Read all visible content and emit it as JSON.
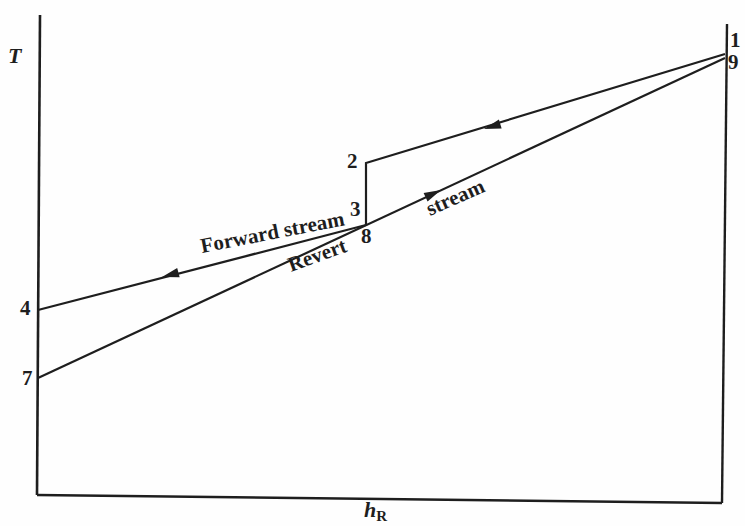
{
  "figure": {
    "paper_color": "#fefefe",
    "ink_color": "#1e1e1e",
    "width": 745,
    "height": 526,
    "axes": {
      "y_label": "T",
      "y_label_pos": {
        "x": 8,
        "y": 63
      },
      "x_label_base": "h",
      "x_label_subscript": "R",
      "x_label_pos": {
        "x": 364,
        "y": 517
      }
    },
    "frame": [
      {
        "name": "y-axis",
        "x1": 40,
        "y1": 15,
        "x2": 37,
        "y2": 495,
        "w": 2.6
      },
      {
        "name": "x-axis",
        "x1": 37,
        "y1": 495,
        "x2": 722,
        "y2": 503,
        "w": 2.4
      },
      {
        "name": "right-border",
        "x1": 727,
        "y1": 24,
        "x2": 722,
        "y2": 503,
        "w": 2.4
      }
    ],
    "streams": [
      {
        "name": "forward-stream",
        "path": [
          [
            725,
            54
          ],
          [
            366,
            163
          ],
          [
            366,
            225
          ],
          [
            38,
            310
          ]
        ],
        "arrows": [
          {
            "x": 484,
            "y": 129,
            "angle": 163.1
          },
          {
            "x": 162,
            "y": 277,
            "angle": 165
          }
        ]
      },
      {
        "name": "revert-stream",
        "path": [
          [
            38,
            378
          ],
          [
            725,
            58
          ]
        ],
        "arrows": [
          {
            "x": 441,
            "y": 190,
            "angle": -25
          }
        ]
      }
    ],
    "point_labels": [
      {
        "name": "point-label-1",
        "text": "1",
        "x": 730,
        "y": 47
      },
      {
        "name": "point-label-9",
        "text": "9",
        "x": 728,
        "y": 69
      },
      {
        "name": "point-label-2",
        "text": "2",
        "x": 347,
        "y": 168
      },
      {
        "name": "point-label-3",
        "text": "3",
        "x": 350,
        "y": 216
      },
      {
        "name": "point-label-8",
        "text": "8",
        "x": 361,
        "y": 243
      },
      {
        "name": "point-label-4",
        "text": "4",
        "x": 20,
        "y": 315
      },
      {
        "name": "point-label-7",
        "text": "7",
        "x": 22,
        "y": 385
      }
    ],
    "stream_labels": [
      {
        "name": "forward-stream-label",
        "text": "Forward stream",
        "x": 202,
        "y": 253,
        "angle": -11
      },
      {
        "name": "revert-word-label",
        "text": "Revert",
        "x": 291,
        "y": 272,
        "angle": -20
      },
      {
        "name": "stream-word-label",
        "text": "stream",
        "x": 430,
        "y": 216,
        "angle": -24
      }
    ]
  }
}
